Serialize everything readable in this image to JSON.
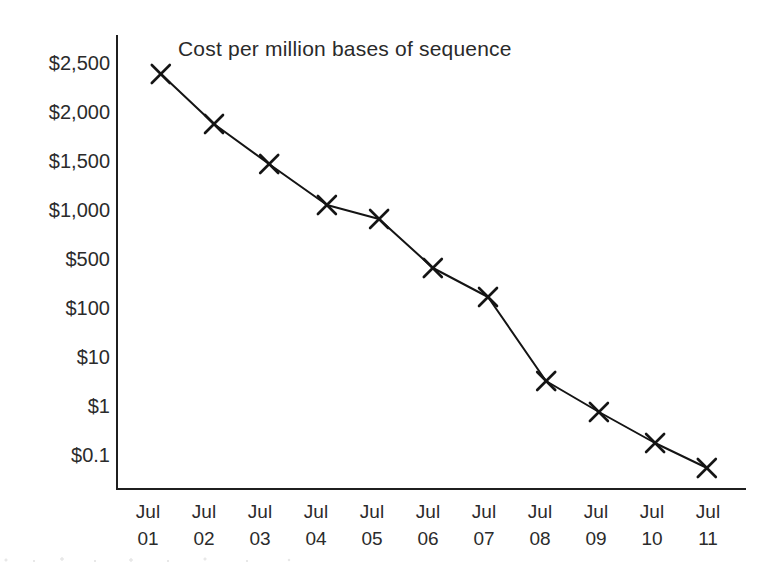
{
  "chart_data": {
    "type": "line",
    "title": "Cost per million bases of sequence",
    "xlabel": "",
    "ylabel": "",
    "grid": false,
    "legend": false,
    "marker": "x-cross",
    "categories": [
      "Jul 01",
      "Jul 02",
      "Jul 03",
      "Jul 04",
      "Jul 05",
      "Jul 06",
      "Jul 07",
      "Jul 08",
      "Jul 09",
      "Jul 10",
      "Jul 11"
    ],
    "x_tick_lines": [
      {
        "top": "Jul",
        "bottom": "01"
      },
      {
        "top": "Jul",
        "bottom": "02"
      },
      {
        "top": "Jul",
        "bottom": "03"
      },
      {
        "top": "Jul",
        "bottom": "04"
      },
      {
        "top": "Jul",
        "bottom": "05"
      },
      {
        "top": "Jul",
        "bottom": "06"
      },
      {
        "top": "Jul",
        "bottom": "07"
      },
      {
        "top": "Jul",
        "bottom": "08"
      },
      {
        "top": "Jul",
        "bottom": "09"
      },
      {
        "top": "Jul",
        "bottom": "10"
      },
      {
        "top": "Jul",
        "bottom": "11"
      }
    ],
    "y_tick_labels": [
      "$2,500",
      "$2,000",
      "$1,500",
      "$1,000",
      "$500",
      "$100",
      "$10",
      "$1",
      "$0.1"
    ],
    "y_tick_values": [
      2500,
      2000,
      1500,
      1000,
      500,
      100,
      10,
      1,
      0.1
    ],
    "y_axis_note": "quasi-logarithmic, tick labels evenly spaced",
    "values": [
      2400,
      2000,
      1550,
      1120,
      980,
      490,
      230,
      6,
      1,
      0.3,
      0.07
    ],
    "points_px": [
      {
        "x": 161,
        "y": 74
      },
      {
        "x": 214,
        "y": 124
      },
      {
        "x": 269,
        "y": 164
      },
      {
        "x": 327,
        "y": 205
      },
      {
        "x": 379,
        "y": 219
      },
      {
        "x": 433,
        "y": 268
      },
      {
        "x": 488,
        "y": 297
      },
      {
        "x": 546,
        "y": 381
      },
      {
        "x": 599,
        "y": 412
      },
      {
        "x": 655,
        "y": 443
      },
      {
        "x": 707,
        "y": 468
      }
    ],
    "series": [
      {
        "name": "Cost per million bases of sequence",
        "values": [
          2400,
          2000,
          1550,
          1120,
          980,
          490,
          230,
          6,
          1,
          0.3,
          0.07
        ]
      }
    ],
    "colors": {
      "line": "#141414",
      "marker": "#141414",
      "axis": "#1f1f1f",
      "text": "#2b2b2b",
      "background": "#ffffff"
    }
  },
  "layout": {
    "axis": {
      "y_axis_x": 117,
      "y_axis_top": 36,
      "x_axis_y": 489,
      "x_axis_right": 745
    },
    "y_label_right_x": 110,
    "y_label_start_y": 70,
    "y_label_step": 49,
    "x_label_start_x": 148,
    "x_label_step": 56,
    "x_label_top_y": 518,
    "x_label_bottom_y": 545,
    "title": {
      "x": 178,
      "y": 56
    }
  }
}
